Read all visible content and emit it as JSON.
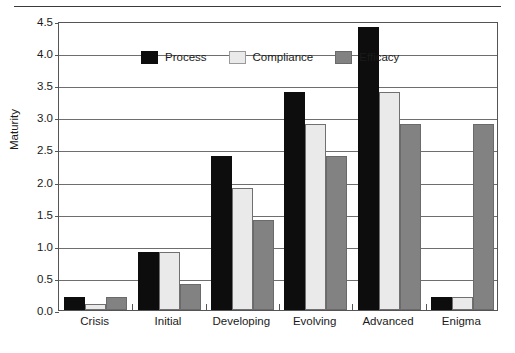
{
  "chart_data": {
    "type": "bar",
    "title": "",
    "subtitle": "",
    "xlabel": "",
    "ylabel": "Maturity",
    "categories": [
      "Crisis",
      "Initial",
      "Developing",
      "Evolving",
      "Advanced",
      "Enigma"
    ],
    "series": [
      {
        "name": "Process",
        "color": "#0d0d0d",
        "values": [
          0.2,
          0.9,
          2.4,
          3.4,
          4.4,
          0.2
        ]
      },
      {
        "name": "Compliance",
        "color": "#eaeaea",
        "values": [
          0.1,
          0.9,
          1.9,
          2.9,
          3.4,
          0.2
        ]
      },
      {
        "name": "Efficacy",
        "color": "#828282",
        "values": [
          0.2,
          0.4,
          1.4,
          2.4,
          2.9,
          2.9
        ]
      }
    ],
    "ylim": [
      0.0,
      4.5
    ],
    "ytick_labels": [
      "0.0",
      "0.5",
      "1.0",
      "1.5",
      "2.0",
      "2.5",
      "3.0",
      "3.5",
      "4.0",
      "4.5"
    ],
    "ytick_values": [
      0.0,
      0.5,
      1.0,
      1.5,
      2.0,
      2.5,
      3.0,
      3.5,
      4.0,
      4.5
    ],
    "grid": true,
    "grid_axis": "y",
    "legend_position": "top-left-inside",
    "legend_entries": [
      "Process",
      "Compliance",
      "Efficacy"
    ]
  },
  "colors": {
    "process": "#0d0d0d",
    "compliance": "#eaeaea",
    "efficacy": "#828282",
    "axis": "#555555",
    "grid": "#6e6e6e",
    "text": "#1a1a1a",
    "rule": "#3a3a3a",
    "background": "#ffffff"
  }
}
